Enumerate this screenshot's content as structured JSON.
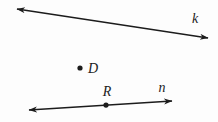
{
  "diagram": {
    "kind": "geometry-figure",
    "ink_color": "#1c1c1c",
    "background_color": "#fdfdfd",
    "lines": [
      {
        "id": "k",
        "label": "k",
        "from": {
          "x": 17,
          "y": 9
        },
        "to": {
          "x": 208,
          "y": 38
        },
        "arrow_start": true,
        "arrow_end": true,
        "label_pos": {
          "x": 195,
          "y": 23,
          "anchor": "middle"
        }
      },
      {
        "id": "n",
        "label": "n",
        "from": {
          "x": 29,
          "y": 110
        },
        "to": {
          "x": 172,
          "y": 101
        },
        "arrow_start": true,
        "arrow_end": true,
        "label_pos": {
          "x": 162,
          "y": 92,
          "anchor": "middle"
        }
      }
    ],
    "points": [
      {
        "id": "D",
        "label": "D",
        "x": 80,
        "y": 68,
        "radius": 2.6,
        "label_pos": {
          "x": 88,
          "y": 73,
          "anchor": "start"
        }
      },
      {
        "id": "R",
        "label": "R",
        "x": 106,
        "y": 105.1,
        "radius": 2.6,
        "label_pos": {
          "x": 107,
          "y": 96,
          "anchor": "middle"
        }
      }
    ]
  }
}
